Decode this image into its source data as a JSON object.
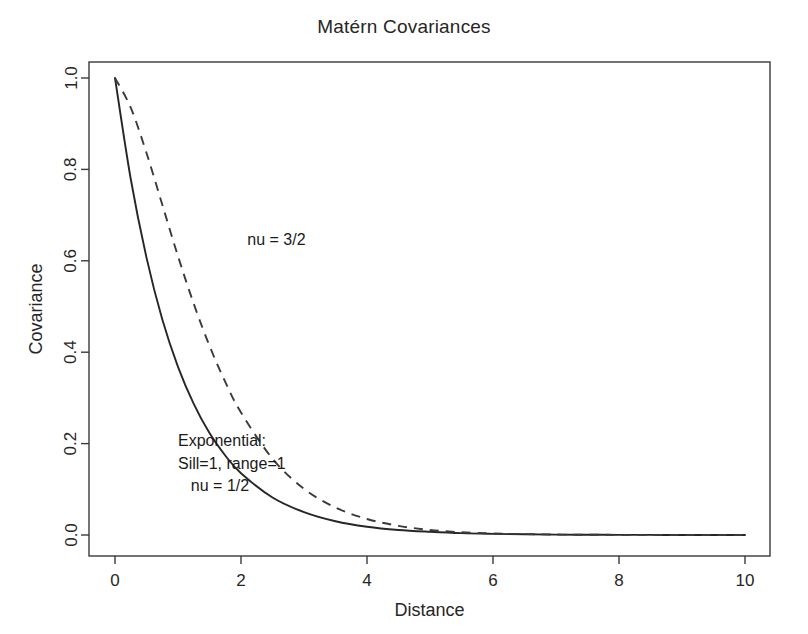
{
  "chart_data": {
    "type": "line",
    "title": "Matérn Covariances",
    "xlabel": "Distance",
    "ylabel": "Covariance",
    "xlim": [
      0,
      10
    ],
    "ylim": [
      0,
      1.0
    ],
    "xticks": [
      "0",
      "2",
      "4",
      "6",
      "8",
      "10"
    ],
    "xtick_values": [
      0,
      2,
      4,
      6,
      8,
      10
    ],
    "yticks": [
      "0.0",
      "0.2",
      "0.4",
      "0.6",
      "0.8",
      "1.0"
    ],
    "ytick_values": [
      0.0,
      0.2,
      0.4,
      0.6,
      0.8,
      1.0
    ],
    "grid": false,
    "legend": "none",
    "series": [
      {
        "name": "nu = 1/2",
        "style": "solid",
        "color": "#262626",
        "x": [
          0,
          0.25,
          0.5,
          0.75,
          1,
          1.25,
          1.5,
          1.75,
          2,
          2.5,
          3,
          3.5,
          4,
          4.5,
          5,
          5.5,
          6,
          6.5,
          7,
          7.5,
          8,
          8.5,
          9,
          9.5,
          10
        ],
        "values": [
          1.0,
          0.779,
          0.607,
          0.472,
          0.368,
          0.287,
          0.223,
          0.174,
          0.135,
          0.082,
          0.05,
          0.03,
          0.018,
          0.011,
          0.007,
          0.004,
          0.0025,
          0.0015,
          0.0009,
          0.0006,
          0.0003,
          0.0002,
          0.0001,
          0.0001,
          0.0
        ]
      },
      {
        "name": "nu = 3/2",
        "style": "dashed",
        "color": "#3a3a3a",
        "x": [
          0,
          0.25,
          0.5,
          0.75,
          1,
          1.25,
          1.5,
          1.75,
          2,
          2.5,
          3,
          3.5,
          4,
          4.5,
          5,
          5.5,
          6,
          6.5,
          7,
          7.5,
          8,
          8.5,
          9,
          9.5,
          10
        ],
        "values": [
          1.0,
          0.935,
          0.836,
          0.723,
          0.61,
          0.506,
          0.414,
          0.335,
          0.268,
          0.167,
          0.101,
          0.06,
          0.035,
          0.02,
          0.011,
          0.006,
          0.0034,
          0.0019,
          0.001,
          0.0006,
          0.0003,
          0.0002,
          0.0001,
          0.0001,
          0.0
        ]
      }
    ],
    "annotations": [
      {
        "id": "nu32",
        "text": "nu = 3/2",
        "x": 2.1,
        "y": 0.635
      },
      {
        "id": "exp1",
        "text": "Exponential:",
        "x": 1.0,
        "y": 0.195
      },
      {
        "id": "exp2",
        "text": "Sill=1, range=1",
        "x": 1.0,
        "y": 0.145
      },
      {
        "id": "exp3",
        "text": "nu = 1/2",
        "x": 1.0,
        "y": 0.097
      }
    ]
  }
}
